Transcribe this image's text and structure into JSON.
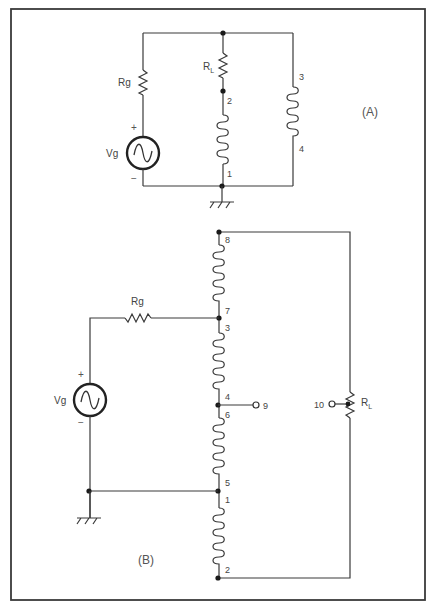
{
  "figure": {
    "frame_color": "#3a3a3a",
    "panels": [
      {
        "id": "A",
        "tag": "(A)",
        "source": {
          "label": "Vg",
          "plus": "+",
          "minus": "−"
        },
        "generator_resistor": {
          "label": "Rg"
        },
        "load_resistor": {
          "label": "R",
          "subscript": "L"
        },
        "coil_left": {
          "top_terminal": "2",
          "bottom_terminal": "1"
        },
        "coil_right": {
          "top_terminal": "3",
          "bottom_terminal": "4"
        },
        "ground": "ground-symbol"
      },
      {
        "id": "B",
        "tag": "(B)",
        "source": {
          "label": "Vg",
          "plus": "+",
          "minus": "−"
        },
        "generator_resistor": {
          "label": "Rg"
        },
        "load_resistor": {
          "label": "R",
          "subscript": "L",
          "wiper_terminal": "10"
        },
        "coils": [
          {
            "top_terminal": "8",
            "bottom_terminal": "7"
          },
          {
            "top_terminal": "3",
            "bottom_terminal": "4"
          },
          {
            "top_terminal": "6",
            "bottom_terminal": "5"
          },
          {
            "top_terminal": "1",
            "bottom_terminal": "2"
          }
        ],
        "tap_terminal": "9",
        "ground": "ground-symbol"
      }
    ]
  }
}
